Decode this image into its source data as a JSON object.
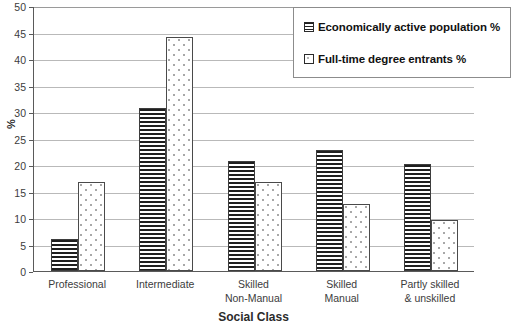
{
  "chart_data": {
    "type": "bar",
    "title": "",
    "xlabel": "Social Class",
    "ylabel": "%",
    "ylim": [
      0,
      50
    ],
    "yticks": [
      0,
      5,
      10,
      15,
      20,
      25,
      30,
      35,
      40,
      45,
      50
    ],
    "grid": true,
    "legend_position": "top-right",
    "categories": [
      "Professional",
      "Intermediate",
      "Skilled Non-Manual",
      "Skilled Manual",
      "Partly skilled & unskilled"
    ],
    "category_lines": [
      [
        "Professional",
        ""
      ],
      [
        "Intermediate",
        ""
      ],
      [
        "Skilled",
        "Non-Manual"
      ],
      [
        "Skilled",
        "Manual"
      ],
      [
        "Partly skilled",
        "& unskilled"
      ]
    ],
    "series": [
      {
        "name": "Economically active population %",
        "fill": "horizontal-hatch",
        "values": [
          6.0,
          30.7,
          20.7,
          22.8,
          20.1
        ]
      },
      {
        "name": "Full-time degree entrants %",
        "fill": "dotted",
        "values": [
          16.8,
          44.2,
          16.8,
          12.7,
          9.6
        ]
      }
    ]
  },
  "legend": {
    "items": [
      {
        "label": "Economically active population %",
        "swatch": "hatch-swatch-icon"
      },
      {
        "label": "Full-time degree entrants %",
        "swatch": "dots-swatch-icon"
      }
    ]
  },
  "axes": {
    "y_title": "%",
    "x_title": "Social Class",
    "y_tick_labels": [
      "50",
      "45",
      "40",
      "35",
      "30",
      "25",
      "20",
      "15",
      "10",
      "5",
      "0"
    ]
  },
  "colors": {
    "series1_line": "#1f1f1f",
    "series2_dot": "#a8a8a8",
    "gridline": "#b9b9b9",
    "axis": "#5a5a5a",
    "background": "#ffffff",
    "text": "#3c3c3c"
  }
}
